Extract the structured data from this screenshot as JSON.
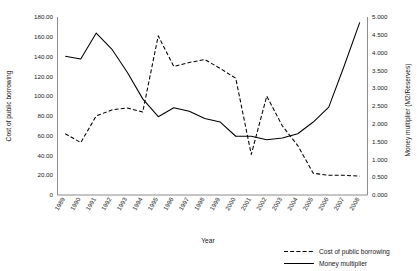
{
  "chart_data": {
    "type": "line",
    "title": "",
    "xlabel": "Year",
    "ylabel": "Cost of public borrowing",
    "y2label": "Money multiplier (M2/Reserves)",
    "grid": false,
    "legend_position": "bottom-right",
    "categories": [
      "1989",
      "1990",
      "1991",
      "1992",
      "1993",
      "1994",
      "1995",
      "1996",
      "1997",
      "1998",
      "1999",
      "2000",
      "2001",
      "2002",
      "2003",
      "2004",
      "2005",
      "2006",
      "2007",
      "2008"
    ],
    "ylim": [
      0,
      180
    ],
    "yticks": [
      "0",
      "20.00",
      "40.00",
      "60.00",
      "80.00",
      "100.00",
      "120.00",
      "140.00",
      "160.00",
      "180.00"
    ],
    "ytick_values": [
      0,
      20,
      40,
      60,
      80,
      100,
      120,
      140,
      160,
      180
    ],
    "y2lim": [
      0,
      5
    ],
    "y2ticks": [
      "0.000",
      "0.500",
      "1.000",
      "1.500",
      "2.000",
      "2.500",
      "3.000",
      "3.500",
      "4.000",
      "4.500",
      "5.000"
    ],
    "y2tick_values": [
      0,
      0.5,
      1.0,
      1.5,
      2.0,
      2.5,
      3.0,
      3.5,
      4.0,
      4.5,
      5.0
    ],
    "series": [
      {
        "name": "Cost of public borrowing",
        "axis": "left",
        "style": "dashed",
        "color": "#000000",
        "values": [
          62,
          53,
          80,
          86,
          88,
          84,
          161,
          130,
          134,
          137,
          128,
          118,
          41,
          100,
          70,
          50,
          22,
          20,
          20,
          19
        ]
      },
      {
        "name": "Money multiplier",
        "axis": "right",
        "style": "solid",
        "color": "#000000",
        "values": [
          3.9,
          3.82,
          4.55,
          4.1,
          3.45,
          2.7,
          2.2,
          2.45,
          2.35,
          2.15,
          2.05,
          1.65,
          1.65,
          1.55,
          1.6,
          1.72,
          2.05,
          2.47,
          3.63,
          4.85
        ]
      }
    ]
  },
  "legend": {
    "items": [
      {
        "label": "Cost of public borrowing",
        "style": "dashed"
      },
      {
        "label": "Money multiplier",
        "style": "solid"
      }
    ]
  }
}
